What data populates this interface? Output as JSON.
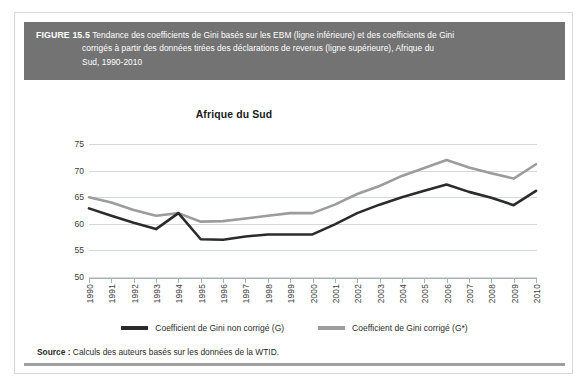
{
  "figure": {
    "label": "FIGURE 15.5",
    "caption_line1": "Tendance des coefficients de Gini basés sur les EBM (ligne inférieure) et des coefficients de Gini",
    "caption_line2": "corrigés à partir des données tirées des déclarations de revenus (ligne supérieure), Afrique du",
    "caption_line3": "Sud, 1990-2010",
    "header_bg": "#737373"
  },
  "source": {
    "label": "Source :",
    "text": "Calculs des auteurs basés sur les données de la WTID."
  },
  "legend": {
    "entries": [
      {
        "label": "Coefficient de Gini non corrigé (G)",
        "color": "#2b2b2b"
      },
      {
        "label": "Coefficient de Gini corrigé (G*)",
        "color": "#9c9c9c"
      }
    ]
  },
  "chart_data": {
    "type": "line",
    "title": "Afrique du Sud",
    "xlabel": "",
    "ylabel": "",
    "ylim": [
      50,
      75
    ],
    "yticks": [
      75,
      70,
      65,
      60,
      55,
      50
    ],
    "grid": true,
    "legend_position": "bottom",
    "categories": [
      "1990",
      "1991",
      "1992",
      "1993",
      "1994",
      "1995",
      "1996",
      "1997",
      "1998",
      "1999",
      "2000",
      "2001",
      "2002",
      "2003",
      "2004",
      "2005",
      "2006",
      "2007",
      "2008",
      "2009",
      "2010"
    ],
    "series": [
      {
        "name": "Coefficient de Gini non corrigé (G)",
        "color": "#2b2b2b",
        "values": [
          62.9,
          61.5,
          60.2,
          59.0,
          62.0,
          57.1,
          57.0,
          57.6,
          58.0,
          58.0,
          58.0,
          59.9,
          62.0,
          63.6,
          65.0,
          66.2,
          67.4,
          66.0,
          64.9,
          63.5,
          66.2
        ]
      },
      {
        "name": "Coefficient de Gini corrigé (G*)",
        "color": "#9c9c9c",
        "values": [
          65.0,
          64.0,
          62.6,
          61.5,
          62.0,
          60.4,
          60.5,
          61.0,
          61.5,
          62.0,
          62.0,
          63.6,
          65.6,
          67.1,
          69.0,
          70.5,
          72.0,
          70.6,
          69.5,
          68.5,
          71.2
        ]
      }
    ]
  }
}
